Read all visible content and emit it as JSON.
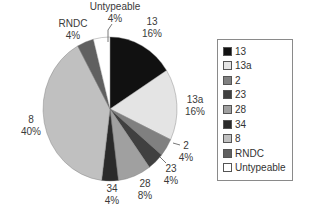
{
  "chart_data": {
    "type": "pie",
    "title": "",
    "start_angle": "12 o'clock",
    "direction": "clockwise",
    "categories": [
      "13",
      "13a",
      "2",
      "23",
      "28",
      "34",
      "8",
      "RNDC",
      "Untypeable"
    ],
    "values": [
      16,
      16,
      4,
      4,
      8,
      4,
      40,
      4,
      4
    ],
    "value_labels": [
      "16%",
      "16%",
      "4%",
      "4%",
      "8%",
      "4%",
      "40%",
      "4%",
      "4%"
    ],
    "colors": [
      "#111111",
      "#e4e4e4",
      "#808080",
      "#404040",
      "#a0a0a0",
      "#2a2a2a",
      "#c0c0c0",
      "#606060",
      "#ffffff"
    ],
    "legend_position": "right"
  },
  "legend": {
    "items": [
      {
        "label": "13",
        "color": "#111111"
      },
      {
        "label": "13a",
        "color": "#e4e4e4"
      },
      {
        "label": "2",
        "color": "#808080"
      },
      {
        "label": "23",
        "color": "#404040"
      },
      {
        "label": "28",
        "color": "#a0a0a0"
      },
      {
        "label": "34",
        "color": "#2a2a2a"
      },
      {
        "label": "8",
        "color": "#c0c0c0"
      },
      {
        "label": "RNDC",
        "color": "#606060"
      },
      {
        "label": "Untypeable",
        "color": "#ffffff"
      }
    ]
  },
  "slice_labels": [
    {
      "name": "13",
      "pct": "16%",
      "x": 152,
      "y": 25,
      "pct_y": 37,
      "anchor": "middle"
    },
    {
      "name": "13a",
      "pct": "16%",
      "x": 195,
      "y": 103,
      "pct_y": 115,
      "anchor": "middle"
    },
    {
      "name": "2",
      "pct": "4%",
      "x": 186,
      "y": 149,
      "pct_y": 161,
      "anchor": "middle"
    },
    {
      "name": "23",
      "pct": "4%",
      "x": 171,
      "y": 172,
      "pct_y": 184,
      "anchor": "middle"
    },
    {
      "name": "28",
      "pct": "8%",
      "x": 145,
      "y": 187,
      "pct_y": 199,
      "anchor": "middle"
    },
    {
      "name": "34",
      "pct": "4%",
      "x": 112,
      "y": 192,
      "pct_y": 204,
      "anchor": "middle"
    },
    {
      "name": "8",
      "pct": "40%",
      "x": 31,
      "y": 123,
      "pct_y": 135,
      "anchor": "middle"
    },
    {
      "name": "RNDC",
      "pct": "4%",
      "x": 73,
      "y": 27,
      "pct_y": 39,
      "anchor": "middle"
    },
    {
      "name": "Untypeable",
      "pct": "4%",
      "x": 115,
      "y": 10,
      "pct_y": 22,
      "anchor": "middle"
    }
  ]
}
